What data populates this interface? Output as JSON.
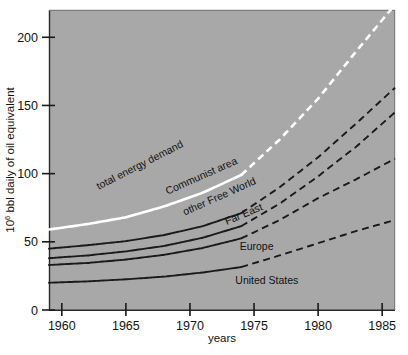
{
  "chart_data": {
    "type": "line",
    "title": "",
    "xlabel": "years",
    "ylabel": "10⁶ bbl daily of oil equivalent",
    "ylabel_base": "10",
    "ylabel_exp": "6",
    "ylabel_rest": " bbl daily of oil equivalent",
    "xlim": [
      1959,
      1986
    ],
    "ylim": [
      0,
      220
    ],
    "xticks": [
      "1960",
      "1965",
      "1970",
      "1975",
      "1980",
      "1985"
    ],
    "xtick_values": [
      1960,
      1965,
      1970,
      1975,
      1980,
      1985
    ],
    "yticks": [
      "0",
      "50",
      "100",
      "150",
      "200"
    ],
    "ytick_values": [
      0,
      50,
      100,
      150,
      200
    ],
    "grid": false,
    "legend": "inline-labels",
    "plot_background": "#a8a8a8",
    "historic_projection_split_year": 1974,
    "series": [
      {
        "name": "total energy demand",
        "color": "#ffffff",
        "label": "total energy demand",
        "label_x": 1966.2,
        "label_y": 104,
        "label_rotation": -27,
        "x": [
          1959,
          1962,
          1965,
          1968,
          1971,
          1974,
          1977,
          1980,
          1983,
          1986
        ],
        "values": [
          59,
          63,
          68,
          76,
          86,
          99,
          125,
          155,
          190,
          224
        ]
      },
      {
        "name": "Communist area",
        "color": "#1a1a1a",
        "label": "Communist area",
        "label_x": 1971.0,
        "label_y": 96,
        "label_rotation": -24,
        "x": [
          1959,
          1962,
          1965,
          1968,
          1971,
          1974,
          1977,
          1980,
          1983,
          1986
        ],
        "values": [
          45,
          47.5,
          50.5,
          55,
          61.5,
          71,
          90,
          112,
          137,
          163
        ]
      },
      {
        "name": "other Free World",
        "color": "#1a1a1a",
        "label": "other Free World",
        "label_x": 1972.4,
        "label_y": 81,
        "label_rotation": -24,
        "x": [
          1959,
          1962,
          1965,
          1968,
          1971,
          1974,
          1977,
          1980,
          1983,
          1986
        ],
        "values": [
          38,
          40,
          43,
          47,
          53,
          61.5,
          78,
          98,
          120,
          145
        ]
      },
      {
        "name": "Far East",
        "color": "#1a1a1a",
        "label": "Far East",
        "label_x": 1974.3,
        "label_y": 68,
        "label_rotation": -23,
        "x": [
          1959,
          1962,
          1965,
          1968,
          1971,
          1974,
          1977,
          1980,
          1983,
          1986
        ],
        "values": [
          33,
          34.5,
          37,
          40.5,
          45.5,
          52.5,
          66,
          82,
          96,
          111
        ]
      },
      {
        "name": "Europe",
        "color": "#1a1a1a",
        "label": "Europe",
        "label_x": 1975.2,
        "label_y": 44,
        "label_rotation": 0,
        "x": [
          1959,
          1962,
          1965,
          1968,
          1971,
          1974,
          1977,
          1980,
          1983,
          1986
        ],
        "values": [
          20,
          21,
          22.5,
          24.5,
          27.5,
          31.5,
          40,
          49,
          58,
          66
        ]
      },
      {
        "name": "United States",
        "color": "#1a1a1a",
        "label": "United States",
        "label_x": 1976.0,
        "label_y": 19,
        "label_rotation": 0,
        "x": [
          1959,
          1986
        ],
        "values": [
          0,
          0
        ],
        "is_label_only": true
      }
    ]
  }
}
